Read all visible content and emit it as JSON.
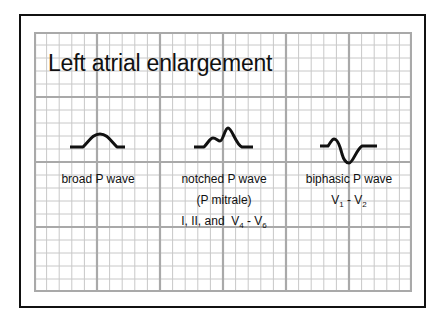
{
  "title": "Left atrial enlargement",
  "panels": [
    {
      "id": "broad",
      "lines": [
        "broad P wave"
      ]
    },
    {
      "id": "notched",
      "lines": [
        "notched  P wave",
        "(P mitrale)"
      ],
      "leads": {
        "prefix": "I, II, and  V",
        "sub1": "4",
        "mid": " - V",
        "sub2": "6"
      }
    },
    {
      "id": "biphasic",
      "lines": [
        "biphasic P wave"
      ],
      "leads": {
        "prefix": "V",
        "sub1": "1",
        "mid": " - V",
        "sub2": "2"
      }
    }
  ],
  "colors": {
    "grid_minor": "#c8c8c8",
    "grid_major": "#a9a9a9",
    "trace": "#111111",
    "border": "#111111"
  }
}
